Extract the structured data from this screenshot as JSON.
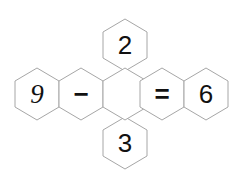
{
  "diagram": {
    "background_color": "#ffffff",
    "stroke_color": "#a6a6a6",
    "text_color": "#111111",
    "canvas": {
      "width": 248,
      "height": 193
    },
    "equation_text": "9 - 2 3 = 6",
    "hex_geometry": {
      "width": 44,
      "height": 52,
      "orientation": "pointy-top"
    },
    "cells": [
      {
        "id": "cell-left-nine",
        "name": "hex-cell-9",
        "label": "9",
        "kind": "digit",
        "style": "italic",
        "cx": 37,
        "cy": 94
      },
      {
        "id": "cell-minus",
        "name": "hex-cell-minus",
        "label": "−",
        "kind": "operator",
        "style": "upright",
        "cx": 81,
        "cy": 94
      },
      {
        "id": "cell-top-two",
        "name": "hex-cell-2",
        "label": "2",
        "kind": "digit",
        "style": "upright",
        "cx": 125,
        "cy": 45
      },
      {
        "id": "cell-bottom-three",
        "name": "hex-cell-3",
        "label": "3",
        "kind": "digit",
        "style": "upright",
        "cx": 125,
        "cy": 143
      },
      {
        "id": "cell-center",
        "name": "hex-cell-center",
        "label": "",
        "kind": "empty",
        "style": "upright",
        "cx": 125,
        "cy": 94
      },
      {
        "id": "cell-equals",
        "name": "hex-cell-equals",
        "label": "=",
        "kind": "operator",
        "style": "upright",
        "cx": 162,
        "cy": 94
      },
      {
        "id": "cell-right-six",
        "name": "hex-cell-6",
        "label": "6",
        "kind": "digit",
        "style": "upright",
        "cx": 206,
        "cy": 94
      }
    ]
  }
}
